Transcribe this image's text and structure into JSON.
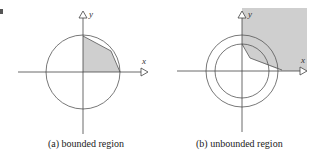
{
  "figures": [
    {
      "id": "a",
      "caption": "(a)  bounded region",
      "x_axis_label": "x",
      "y_axis_label": "y",
      "shape": "circle",
      "shaded": "bounded polygon in first quadrant inside circle"
    },
    {
      "id": "b",
      "caption": "(b)  unbounded region",
      "x_axis_label": "x",
      "y_axis_label": "y",
      "shape": "two concentric circles",
      "shaded": "unbounded region in first quadrant outside inner boundary"
    }
  ],
  "colors": {
    "line": "#444444",
    "shade": "#cfcfcf",
    "background": "#ffffff"
  }
}
